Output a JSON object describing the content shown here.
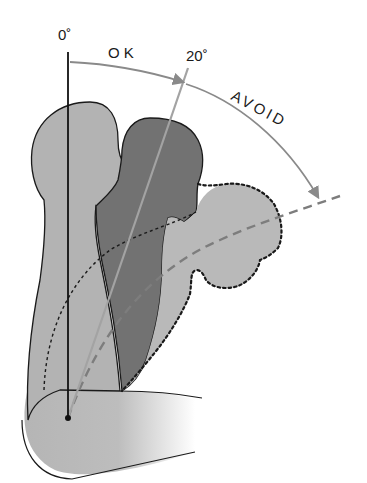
{
  "diagram": {
    "labels": {
      "angle_zero": "0˚",
      "angle_twenty": "20˚",
      "ok": "OK",
      "avoid": "AVOID"
    },
    "figures": [
      {
        "name": "upright",
        "angle_deg": 0,
        "fill": "#b3b3b3",
        "outline": "solid"
      },
      {
        "name": "ok-lean",
        "angle_deg": 20,
        "fill": "#727272",
        "outline": "solid"
      },
      {
        "name": "avoid-lean",
        "angle_deg": 55,
        "fill": "#b8b8b8",
        "outline": "dotted"
      }
    ],
    "colors": {
      "upright_fill": "#b3b3b3",
      "ok_fill": "#717171",
      "avoid_fill": "#bababa",
      "outline": "#1a1a1a",
      "arc": "#8a8a8a",
      "ref_line": "#a0a0a0",
      "dashed_line": "#7d7d7d"
    }
  }
}
